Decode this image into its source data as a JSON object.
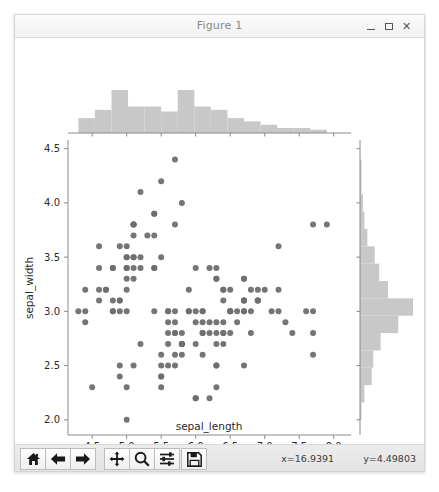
{
  "window": {
    "title": "Figure 1",
    "minimize_label": "–",
    "maximize_label": "□",
    "close_label": "✕"
  },
  "toolbar": {
    "buttons": [
      {
        "name": "home-icon",
        "tooltip": "Home"
      },
      {
        "name": "back-arrow-icon",
        "tooltip": "Back"
      },
      {
        "name": "forward-arrow-icon",
        "tooltip": "Forward"
      },
      {
        "name": "pan-move-icon",
        "tooltip": "Pan"
      },
      {
        "name": "zoom-magnifier-icon",
        "tooltip": "Zoom to rectangle"
      },
      {
        "name": "configure-sliders-icon",
        "tooltip": "Configure subplots"
      },
      {
        "name": "save-floppy-icon",
        "tooltip": "Save the figure"
      }
    ],
    "coord_x": "x=16.9391",
    "coord_y": "y=4.49803"
  },
  "chart_data": {
    "type": "scatter",
    "title": "",
    "xlabel": "sepal_length",
    "ylabel": "sepal_width",
    "xlim": [
      4.15,
      8.25
    ],
    "ylim": [
      1.86,
      4.58
    ],
    "xticks": [
      "4.5",
      "5.0",
      "5.5",
      "6.0",
      "6.5",
      "7.0",
      "7.5",
      "8.0"
    ],
    "xtick_values": [
      4.5,
      5.0,
      5.5,
      6.0,
      6.5,
      7.0,
      7.5,
      8.0
    ],
    "yticks": [
      "2.0",
      "2.5",
      "3.0",
      "3.5",
      "4.0",
      "4.5"
    ],
    "ytick_values": [
      2.0,
      2.5,
      3.0,
      3.5,
      4.0,
      4.5
    ],
    "grid": false,
    "legend": null,
    "marker_color": "#6e6e6e",
    "marker_size": 6,
    "hist_color": "#c8c8c8",
    "points": [
      [
        5.1,
        3.5
      ],
      [
        4.9,
        3.0
      ],
      [
        4.7,
        3.2
      ],
      [
        4.6,
        3.1
      ],
      [
        5.0,
        3.6
      ],
      [
        5.4,
        3.9
      ],
      [
        4.6,
        3.4
      ],
      [
        5.0,
        3.4
      ],
      [
        4.4,
        2.9
      ],
      [
        4.9,
        3.1
      ],
      [
        5.4,
        3.7
      ],
      [
        4.8,
        3.4
      ],
      [
        4.8,
        3.0
      ],
      [
        4.3,
        3.0
      ],
      [
        5.8,
        4.0
      ],
      [
        5.7,
        4.4
      ],
      [
        5.4,
        3.9
      ],
      [
        5.1,
        3.5
      ],
      [
        5.7,
        3.8
      ],
      [
        5.1,
        3.8
      ],
      [
        5.4,
        3.4
      ],
      [
        5.1,
        3.7
      ],
      [
        4.6,
        3.6
      ],
      [
        5.1,
        3.3
      ],
      [
        4.8,
        3.4
      ],
      [
        5.0,
        3.0
      ],
      [
        5.0,
        3.4
      ],
      [
        5.2,
        3.5
      ],
      [
        5.2,
        3.4
      ],
      [
        4.7,
        3.2
      ],
      [
        4.8,
        3.1
      ],
      [
        5.4,
        3.4
      ],
      [
        5.2,
        4.1
      ],
      [
        5.5,
        4.2
      ],
      [
        4.9,
        3.1
      ],
      [
        5.0,
        3.2
      ],
      [
        5.5,
        3.5
      ],
      [
        4.9,
        3.6
      ],
      [
        4.4,
        3.0
      ],
      [
        5.1,
        3.4
      ],
      [
        5.0,
        3.5
      ],
      [
        4.5,
        2.3
      ],
      [
        4.4,
        3.2
      ],
      [
        5.0,
        3.5
      ],
      [
        5.1,
        3.8
      ],
      [
        4.8,
        3.0
      ],
      [
        5.1,
        3.8
      ],
      [
        4.6,
        3.2
      ],
      [
        5.3,
        3.7
      ],
      [
        5.0,
        3.3
      ],
      [
        7.0,
        3.2
      ],
      [
        6.4,
        3.2
      ],
      [
        6.9,
        3.1
      ],
      [
        5.5,
        2.3
      ],
      [
        6.5,
        2.8
      ],
      [
        5.7,
        2.8
      ],
      [
        6.3,
        3.3
      ],
      [
        4.9,
        2.4
      ],
      [
        6.6,
        2.9
      ],
      [
        5.2,
        2.7
      ],
      [
        5.0,
        2.0
      ],
      [
        5.9,
        3.0
      ],
      [
        6.0,
        2.2
      ],
      [
        6.1,
        2.9
      ],
      [
        5.6,
        2.9
      ],
      [
        6.7,
        3.1
      ],
      [
        5.6,
        3.0
      ],
      [
        5.8,
        2.7
      ],
      [
        6.2,
        2.2
      ],
      [
        5.6,
        2.5
      ],
      [
        5.9,
        3.2
      ],
      [
        6.1,
        2.8
      ],
      [
        6.3,
        2.5
      ],
      [
        6.1,
        2.8
      ],
      [
        6.4,
        2.9
      ],
      [
        6.6,
        3.0
      ],
      [
        6.8,
        2.8
      ],
      [
        6.7,
        3.0
      ],
      [
        6.0,
        2.9
      ],
      [
        5.7,
        2.6
      ],
      [
        5.5,
        2.4
      ],
      [
        5.5,
        2.4
      ],
      [
        5.8,
        2.7
      ],
      [
        6.0,
        2.7
      ],
      [
        5.4,
        3.0
      ],
      [
        6.0,
        3.4
      ],
      [
        6.7,
        3.1
      ],
      [
        6.3,
        2.3
      ],
      [
        5.6,
        3.0
      ],
      [
        5.5,
        2.5
      ],
      [
        5.5,
        2.6
      ],
      [
        6.1,
        3.0
      ],
      [
        5.8,
        2.6
      ],
      [
        5.0,
        2.3
      ],
      [
        5.6,
        2.7
      ],
      [
        5.7,
        3.0
      ],
      [
        5.7,
        2.9
      ],
      [
        6.2,
        2.9
      ],
      [
        5.1,
        2.5
      ],
      [
        5.7,
        2.8
      ],
      [
        6.3,
        3.3
      ],
      [
        5.8,
        2.7
      ],
      [
        7.1,
        3.0
      ],
      [
        6.3,
        2.9
      ],
      [
        6.5,
        3.0
      ],
      [
        7.6,
        3.0
      ],
      [
        4.9,
        2.5
      ],
      [
        7.3,
        2.9
      ],
      [
        6.7,
        2.5
      ],
      [
        7.2,
        3.6
      ],
      [
        6.5,
        3.2
      ],
      [
        6.4,
        2.7
      ],
      [
        6.8,
        3.0
      ],
      [
        5.7,
        2.5
      ],
      [
        5.8,
        2.8
      ],
      [
        6.4,
        3.2
      ],
      [
        6.5,
        3.0
      ],
      [
        7.7,
        3.8
      ],
      [
        7.7,
        2.6
      ],
      [
        6.0,
        2.2
      ],
      [
        6.9,
        3.2
      ],
      [
        5.6,
        2.8
      ],
      [
        7.7,
        2.8
      ],
      [
        6.3,
        2.7
      ],
      [
        6.7,
        3.3
      ],
      [
        7.2,
        3.2
      ],
      [
        6.2,
        2.8
      ],
      [
        6.1,
        3.0
      ],
      [
        6.4,
        2.8
      ],
      [
        7.2,
        3.0
      ],
      [
        7.4,
        2.8
      ],
      [
        7.9,
        3.8
      ],
      [
        6.4,
        2.8
      ],
      [
        6.3,
        2.8
      ],
      [
        6.1,
        2.6
      ],
      [
        7.7,
        3.0
      ],
      [
        6.3,
        3.4
      ],
      [
        6.4,
        3.1
      ],
      [
        6.0,
        3.0
      ],
      [
        6.9,
        3.1
      ],
      [
        6.7,
        3.1
      ],
      [
        6.9,
        3.1
      ],
      [
        5.8,
        2.7
      ],
      [
        6.8,
        3.2
      ],
      [
        6.7,
        3.3
      ],
      [
        6.7,
        3.0
      ],
      [
        6.3,
        2.5
      ],
      [
        6.5,
        3.0
      ],
      [
        6.2,
        3.4
      ],
      [
        5.9,
        3.0
      ]
    ],
    "hist_top": {
      "orientation": "vertical",
      "bin_edges": [
        4.3,
        4.54,
        4.78,
        5.02,
        5.26,
        5.5,
        5.74,
        5.98,
        6.22,
        6.46,
        6.7,
        6.94,
        7.18,
        7.42,
        7.66,
        7.9
      ],
      "counts": [
        9,
        14,
        26,
        16,
        16,
        13,
        26,
        16,
        14,
        9,
        7,
        5,
        3,
        3,
        2
      ]
    },
    "hist_right": {
      "orientation": "horizontal",
      "bin_edges": [
        2.0,
        2.16,
        2.32,
        2.48,
        2.64,
        2.8,
        2.96,
        3.12,
        3.28,
        3.44,
        3.6,
        3.76,
        3.92,
        4.08,
        4.24,
        4.4
      ],
      "counts": [
        1,
        3,
        8,
        9,
        14,
        26,
        36,
        19,
        13,
        10,
        5,
        3,
        2,
        1,
        1
      ]
    }
  }
}
